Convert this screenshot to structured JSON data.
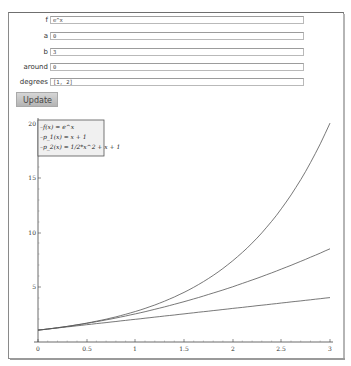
{
  "form": {
    "fields": [
      {
        "label": "f",
        "value": "e^x"
      },
      {
        "label": "a",
        "value": "0"
      },
      {
        "label": "b",
        "value": "3"
      },
      {
        "label": "around",
        "value": "0"
      },
      {
        "label": "degrees",
        "value": "[1, 2]"
      }
    ],
    "update_label": "Update"
  },
  "plot": {
    "legend": [
      "f(x) = e^x",
      "p_1(x) = x + 1",
      "p_2(x) = 1/2*x^2 + x + 1"
    ],
    "x_ticks": [
      "0",
      "0.5",
      "1",
      "1.5",
      "2",
      "2.5",
      "3"
    ],
    "y_ticks": [
      "5",
      "10",
      "15",
      "20"
    ],
    "line_color": "#555555"
  },
  "chart_data": {
    "type": "line",
    "title": "",
    "xlabel": "",
    "ylabel": "",
    "xlim": [
      0,
      3
    ],
    "ylim": [
      0,
      20.1
    ],
    "x_ticks": [
      0,
      0.5,
      1,
      1.5,
      2,
      2.5,
      3
    ],
    "y_ticks": [
      5,
      10,
      15,
      20
    ],
    "legend_position": "upper left",
    "grid": false,
    "x": [
      0,
      0.5,
      1,
      1.5,
      2,
      2.5,
      3
    ],
    "series": [
      {
        "name": "f(x) = e^x",
        "values": [
          1,
          1.65,
          2.72,
          4.48,
          7.39,
          12.18,
          20.09
        ]
      },
      {
        "name": "p_1(x) = x + 1",
        "values": [
          1,
          1.5,
          2,
          2.5,
          3,
          3.5,
          4
        ]
      },
      {
        "name": "p_2(x) = 1/2*x^2 + x + 1",
        "values": [
          1,
          1.625,
          2.5,
          3.625,
          5,
          6.625,
          8.5
        ]
      }
    ]
  }
}
